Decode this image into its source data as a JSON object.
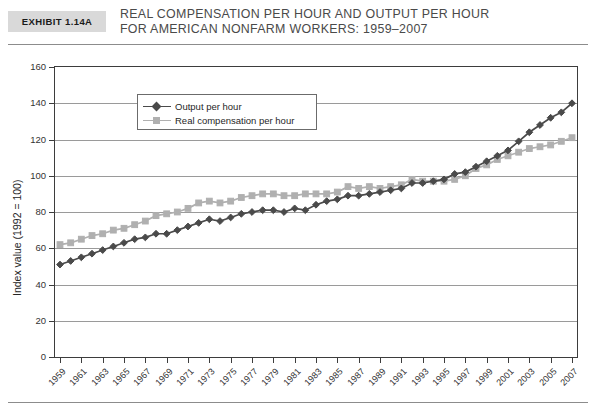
{
  "header": {
    "exhibit_label": "Exhibit 1.14A",
    "title_line1": "Real Compensation per Hour and Output per Hour",
    "title_line2": "for American Nonfarm Workers: 1959–2007"
  },
  "legend": {
    "items": [
      {
        "label": "Output per hour",
        "color": "#4a4a4a",
        "marker": "diamond"
      },
      {
        "label": "Real compensation per hour",
        "color": "#b0b0b0",
        "marker": "square"
      }
    ]
  },
  "chart_data": {
    "type": "line",
    "title": "Real Compensation per Hour and Output per Hour for American Nonfarm Workers: 1959–2007",
    "xlabel": "",
    "ylabel": "Index value (1992 = 100)",
    "ylim": [
      0,
      160
    ],
    "yticks": [
      0,
      20,
      40,
      60,
      80,
      100,
      120,
      140,
      160
    ],
    "grid": true,
    "legend_position": "upper-left-inside",
    "x": [
      1959,
      1960,
      1961,
      1962,
      1963,
      1964,
      1965,
      1966,
      1967,
      1968,
      1969,
      1970,
      1971,
      1972,
      1973,
      1974,
      1975,
      1976,
      1977,
      1978,
      1979,
      1980,
      1981,
      1982,
      1983,
      1984,
      1985,
      1986,
      1987,
      1988,
      1989,
      1990,
      1991,
      1992,
      1993,
      1994,
      1995,
      1996,
      1997,
      1998,
      1999,
      2000,
      2001,
      2002,
      2003,
      2004,
      2005,
      2006,
      2007
    ],
    "xtick_labels": [
      1959,
      1961,
      1963,
      1965,
      1967,
      1969,
      1971,
      1973,
      1975,
      1977,
      1979,
      1981,
      1983,
      1985,
      1987,
      1989,
      1991,
      1993,
      1995,
      1997,
      1999,
      2001,
      2003,
      2005,
      2007
    ],
    "series": [
      {
        "name": "Output per hour",
        "color": "#4a4a4a",
        "marker": "diamond",
        "values": [
          51,
          53,
          55,
          57,
          59,
          61,
          63,
          65,
          66,
          68,
          68,
          70,
          72,
          74,
          76,
          75,
          77,
          79,
          80,
          81,
          81,
          80,
          82,
          81,
          84,
          86,
          87,
          89,
          89,
          90,
          91,
          92,
          93,
          96,
          96,
          97,
          98,
          101,
          102,
          105,
          108,
          111,
          114,
          119,
          124,
          128,
          132,
          135,
          140
        ]
      },
      {
        "name": "Real compensation per hour",
        "color": "#b0b0b0",
        "marker": "square",
        "values": [
          62,
          63,
          65,
          67,
          68,
          70,
          71,
          73,
          75,
          78,
          79,
          80,
          82,
          85,
          86,
          85,
          86,
          88,
          89,
          90,
          90,
          89,
          89,
          90,
          90,
          90,
          91,
          94,
          93,
          94,
          93,
          94,
          95,
          98,
          97,
          97,
          97,
          98,
          100,
          104,
          106,
          109,
          111,
          113,
          115,
          116,
          117,
          119,
          121
        ]
      }
    ]
  }
}
